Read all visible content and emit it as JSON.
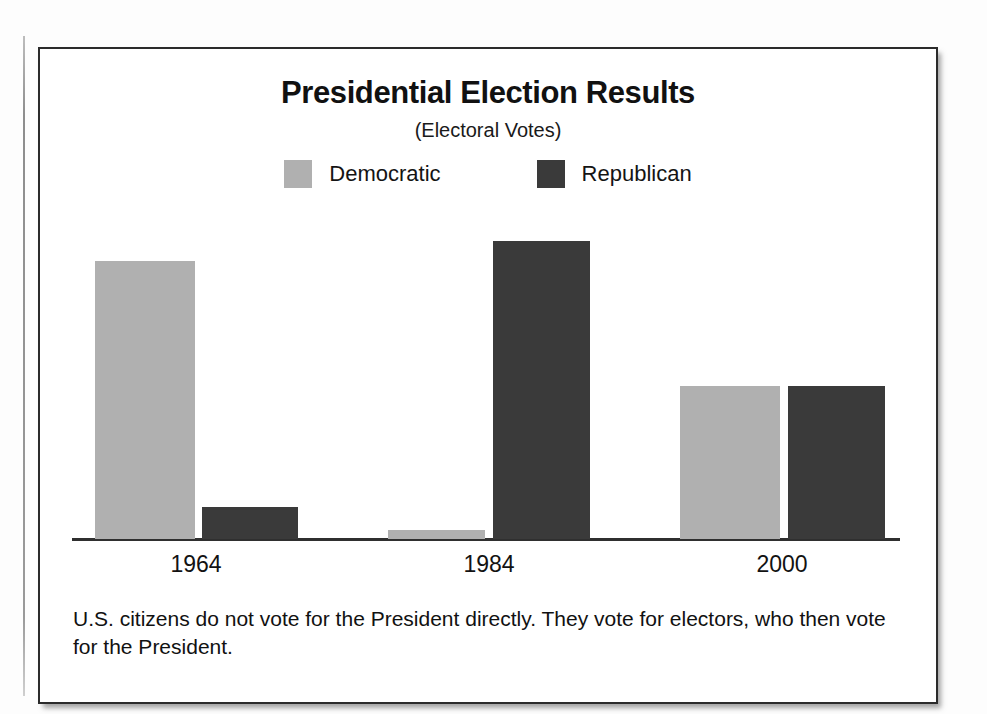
{
  "figure": {
    "title": "Presidential Election Results",
    "subtitle": "(Electoral Votes)",
    "caption": "U.S. citizens do not vote for the President directly. They vote for electors, who then vote for the President."
  },
  "legend": {
    "items": [
      {
        "label": "Democratic",
        "color": "#b0b0b0"
      },
      {
        "label": "Republican",
        "color": "#3a3a3a"
      }
    ]
  },
  "chart_data": {
    "type": "bar",
    "title": "Presidential Election Results",
    "subtitle": "(Electoral Votes)",
    "xlabel": "",
    "ylabel": "Electoral Votes",
    "categories": [
      "1964",
      "1984",
      "2000"
    ],
    "series": [
      {
        "name": "Democratic",
        "color": "#b0b0b0",
        "values": [
          486,
          13,
          266
        ]
      },
      {
        "name": "Republican",
        "color": "#3a3a3a",
        "values": [
          52,
          525,
          271
        ]
      }
    ],
    "ylim": [
      0,
      560
    ],
    "grid": false,
    "axis": "x-axis baseline only, no y-axis ticks or gridlines",
    "legend_position": "top-center",
    "bar_geometry": {
      "note": "bar top/bottom measured in source pixels; baseline y=537",
      "bars": [
        {
          "category": "1964",
          "series": "Democratic",
          "x": 95,
          "width": 100,
          "top": 259,
          "height": 278
        },
        {
          "category": "1964",
          "series": "Republican",
          "x": 202,
          "width": 96,
          "top": 505,
          "height": 32
        },
        {
          "category": "1984",
          "series": "Democratic",
          "x": 388,
          "width": 97,
          "top": 528,
          "height": 9
        },
        {
          "category": "1984",
          "series": "Republican",
          "x": 493,
          "width": 97,
          "top": 239,
          "height": 298
        },
        {
          "category": "2000",
          "series": "Democratic",
          "x": 680,
          "width": 100,
          "top": 384,
          "height": 153
        },
        {
          "category": "2000",
          "series": "Republican",
          "x": 788,
          "width": 97,
          "top": 384,
          "height": 153
        }
      ]
    }
  },
  "x_axis": {
    "ticks": [
      {
        "label": "1964",
        "center": 196
      },
      {
        "label": "1984",
        "center": 489
      },
      {
        "label": "2000",
        "center": 782
      }
    ]
  }
}
